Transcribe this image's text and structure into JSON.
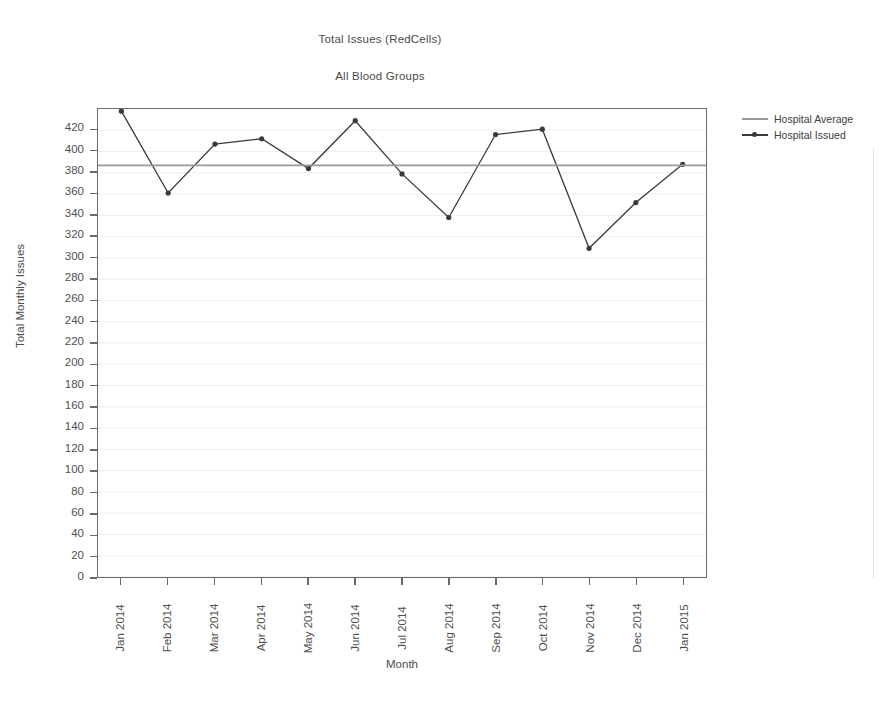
{
  "chart_data": {
    "type": "line",
    "title": "Total Issues (RedCells)",
    "subtitle": "All Blood Groups",
    "xlabel": "Month",
    "ylabel": "Total Monthly Issues",
    "categories": [
      "Jan 2014",
      "Feb 2014",
      "Mar 2014",
      "Apr 2014",
      "May 2014",
      "Jun 2014",
      "Jul 2014",
      "Aug 2014",
      "Sep 2014",
      "Oct 2014",
      "Nov 2014",
      "Dec 2014",
      "Jan 2015"
    ],
    "series": [
      {
        "name": "Hospital Issued",
        "type": "line-markers",
        "color": "#3a3a3a",
        "values": [
          438,
          361,
          407,
          412,
          384,
          429,
          379,
          338,
          416,
          421,
          309,
          352,
          388
        ]
      },
      {
        "name": "Hospital Average",
        "type": "horizontal-line",
        "color": "#9a9a9a",
        "value": 387
      }
    ],
    "ylim": [
      0,
      440
    ],
    "ytick_step": 20,
    "yticks": [
      0,
      20,
      40,
      60,
      80,
      100,
      120,
      140,
      160,
      180,
      200,
      220,
      240,
      260,
      280,
      300,
      320,
      340,
      360,
      380,
      400,
      420
    ],
    "ytick_labels": [
      "0",
      "20",
      "40",
      "60",
      "80",
      "100",
      "120",
      "140",
      "160",
      "180",
      "200",
      "220",
      "240",
      "260",
      "280",
      "300",
      "320",
      "340",
      "360",
      "380",
      "400",
      "420"
    ],
    "grid": true,
    "grid_color": "#eeeeee",
    "legend_position": "right-top",
    "axis_color": "#6a6a6a",
    "background": "#ffffff"
  },
  "legend": {
    "items": [
      {
        "label": "Hospital Average",
        "color": "#9a9a9a",
        "marker": false
      },
      {
        "label": "Hospital Issued",
        "color": "#3a3a3a",
        "marker": true
      }
    ]
  }
}
